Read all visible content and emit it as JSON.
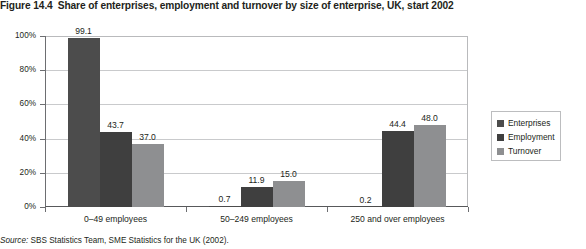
{
  "figure": {
    "number": "Figure 14.4",
    "title": "Share of enterprises, employment and turnover by size of enterprise, UK, start 2002",
    "source_prefix": "Source:",
    "source_text": " SBS Statistics Team, SME Statistics for the UK (2002)."
  },
  "colors": {
    "enterprises": "#4c4c4c",
    "employment": "#3f3f3f",
    "turnover": "#8e8f91",
    "gridline": "#c9cacc",
    "axis": "#58595b",
    "text": "#231f20",
    "legend_border": "#bcbdbf"
  },
  "chart_data": {
    "type": "bar",
    "title": "Share of enterprises, employment and turnover by size of enterprise, UK, start 2002",
    "xlabel": "",
    "ylabel": "",
    "ylim": [
      0,
      100
    ],
    "yticks": [
      0,
      20,
      40,
      60,
      80,
      100
    ],
    "ytick_labels": [
      "0%",
      "20%",
      "40%",
      "60%",
      "80%",
      "100%"
    ],
    "grid": true,
    "legend_position": "right",
    "categories": [
      "0–49 employees",
      "50–249 employees",
      "250 and over employees"
    ],
    "series": [
      {
        "name": "Enterprises",
        "color": "#4c4c4c",
        "values": [
          99.1,
          0.7,
          0.2
        ],
        "labels": [
          "99.1",
          "0.7",
          "0.2"
        ]
      },
      {
        "name": "Employment",
        "color": "#3f3f3f",
        "values": [
          43.7,
          11.9,
          44.4
        ],
        "labels": [
          "43.7",
          "11.9",
          "44.4"
        ]
      },
      {
        "name": "Turnover",
        "color": "#8e8f91",
        "values": [
          37.0,
          15.0,
          48.0
        ],
        "labels": [
          "37.0",
          "15.0",
          "48.0"
        ]
      }
    ]
  }
}
